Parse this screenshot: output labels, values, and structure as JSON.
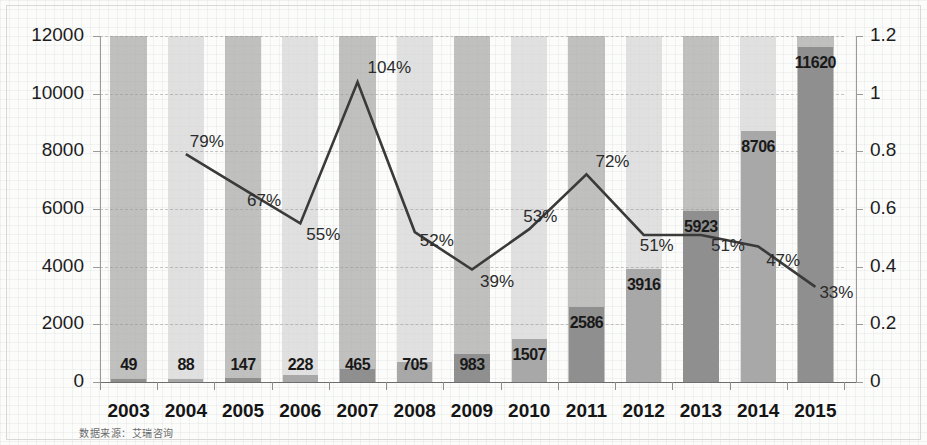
{
  "chart_data": {
    "type": "bar",
    "title": "",
    "subtitle": "",
    "xlabel": "",
    "ylabel": "",
    "y2label": "",
    "grid": true,
    "legend": "none",
    "categories": [
      "2003",
      "2004",
      "2005",
      "2006",
      "2007",
      "2008",
      "2009",
      "2010",
      "2011",
      "2012",
      "2013",
      "2014",
      "2015"
    ],
    "series": [
      {
        "name": "bars",
        "type": "bar",
        "axis": "left",
        "values": [
          49,
          88,
          147,
          228,
          465,
          705,
          983,
          1507,
          2586,
          3916,
          5923,
          8706,
          11620
        ],
        "labels": [
          "49",
          "88",
          "147",
          "228",
          "465",
          "705",
          "983",
          "1507",
          "2586",
          "3916",
          "5923",
          "8706",
          "11620"
        ]
      },
      {
        "name": "growth-rate",
        "type": "line",
        "axis": "right",
        "values": [
          null,
          0.79,
          0.67,
          0.55,
          1.04,
          0.52,
          0.39,
          0.53,
          0.72,
          0.51,
          0.51,
          0.47,
          0.33
        ],
        "labels": [
          null,
          "79%",
          "67%",
          "55%",
          "104%",
          "52%",
          "39%",
          "53%",
          "72%",
          "51%",
          "51%",
          "47%",
          "33%"
        ]
      }
    ],
    "ylim": [
      0,
      12000
    ],
    "yticks": [
      0,
      2000,
      4000,
      6000,
      8000,
      10000,
      12000
    ],
    "ytick_labels": [
      "0",
      "2000",
      "4000",
      "6000",
      "8000",
      "10000",
      "12000"
    ],
    "y2lim": [
      0,
      1.2
    ],
    "y2ticks": [
      0,
      0.2,
      0.4,
      0.6,
      0.8,
      1,
      1.2
    ],
    "y2tick_labels": [
      "0",
      "0.2",
      "0.4",
      "0.6",
      "0.8",
      "1",
      "1.2"
    ]
  },
  "source_note": "数据来源：艾瑞咨询",
  "colors": {
    "band_dark": "#b0b0b0",
    "band_light": "#d6d6d6",
    "bar_dark": "#8f8f8f",
    "bar_light": "#a8a8a8",
    "line": "#3a3a3a",
    "text": "#1d1d1d",
    "axis": "#8d8d8d"
  }
}
